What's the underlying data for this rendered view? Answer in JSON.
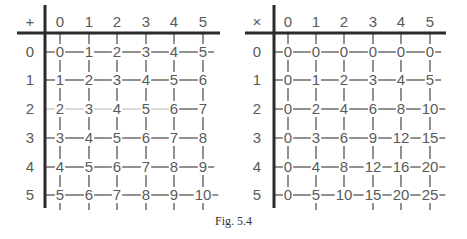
{
  "caption": "Fig. 5.4",
  "colors": {
    "axis": "#2a2a2a",
    "grid": "#555555",
    "faint": "#c8c8c8",
    "text": "#5a5a5a"
  },
  "tables": [
    {
      "name": "addition-table",
      "operator": "+",
      "column_headers": [
        "0",
        "1",
        "2",
        "3",
        "4",
        "5"
      ],
      "row_headers": [
        "0",
        "1",
        "2",
        "3",
        "4",
        "5"
      ],
      "cells": [
        [
          "0",
          "1",
          "2",
          "3",
          "4",
          "5"
        ],
        [
          "1",
          "2",
          "3",
          "4",
          "5",
          "6"
        ],
        [
          "2",
          "3",
          "4",
          "5",
          "6",
          "7"
        ],
        [
          "3",
          "4",
          "5",
          "6",
          "7",
          "8"
        ],
        [
          "4",
          "5",
          "6",
          "7",
          "8",
          "9"
        ],
        [
          "5",
          "6",
          "7",
          "8",
          "9",
          "10"
        ]
      ],
      "trailing_dash": [
        true,
        false,
        false,
        false,
        true,
        true
      ],
      "faint_row": 2,
      "bottom_ticks": [
        0,
        1,
        2,
        3,
        4,
        5
      ],
      "geometry": {
        "vaxis_x": 45,
        "haxis_x0": 17,
        "haxis_x1": 220,
        "row_label_x": 30,
        "cols_x": [
          60,
          89,
          117,
          146,
          174,
          203
        ]
      }
    },
    {
      "name": "multiplication-table",
      "operator": "×",
      "column_headers": [
        "0",
        "1",
        "2",
        "3",
        "4",
        "5"
      ],
      "row_headers": [
        "0",
        "1",
        "2",
        "3",
        "4",
        "5"
      ],
      "cells": [
        [
          "0",
          "0",
          "0",
          "0",
          "0",
          "0"
        ],
        [
          "0",
          "1",
          "2",
          "3",
          "4",
          "5"
        ],
        [
          "0",
          "2",
          "4",
          "6",
          "8",
          "10"
        ],
        [
          "0",
          "3",
          "6",
          "9",
          "12",
          "15"
        ],
        [
          "0",
          "4",
          "8",
          "12",
          "16",
          "20"
        ],
        [
          "0",
          "5",
          "10",
          "15",
          "20",
          "25"
        ]
      ],
      "trailing_dash": [
        true,
        true,
        true,
        true,
        true,
        true
      ],
      "faint_row": -1,
      "bottom_ticks": [
        1,
        3,
        4,
        5
      ],
      "geometry": {
        "vaxis_x": 274,
        "haxis_x0": 245,
        "haxis_x1": 446,
        "row_label_x": 257,
        "cols_x": [
          288,
          316,
          344,
          373,
          401,
          430
        ]
      }
    }
  ],
  "layout": {
    "header_y": 22,
    "haxis_y": 33,
    "rows_y": [
      52,
      80,
      109,
      138,
      167,
      195
    ],
    "vaxis_y0": 5,
    "vaxis_y1": 208
  }
}
